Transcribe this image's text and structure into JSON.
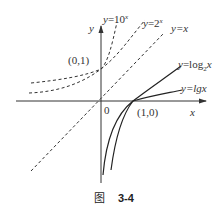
{
  "figure": {
    "caption_prefix": "图",
    "caption_number": "3-4"
  },
  "axes": {
    "x_label": "x",
    "y_label": "y",
    "origin_label": "0"
  },
  "points": [
    {
      "label": "(0,1)"
    },
    {
      "label": "(1,0)"
    }
  ],
  "curves": [
    {
      "id": "exp10",
      "label_prefix": "y=10",
      "label_sup": "x",
      "style": "dashed"
    },
    {
      "id": "exp2",
      "label_prefix": "y=2",
      "label_sup": "x",
      "style": "dashed"
    },
    {
      "id": "identity",
      "label": "y=x",
      "style": "dashed"
    },
    {
      "id": "log2",
      "label_prefix": "y=log",
      "label_sub": "2",
      "label_suffix": "x",
      "style": "solid"
    },
    {
      "id": "lg",
      "label": "y=lgx",
      "style": "solid"
    }
  ],
  "colors": {
    "line": "#333333",
    "text": "#333333"
  }
}
